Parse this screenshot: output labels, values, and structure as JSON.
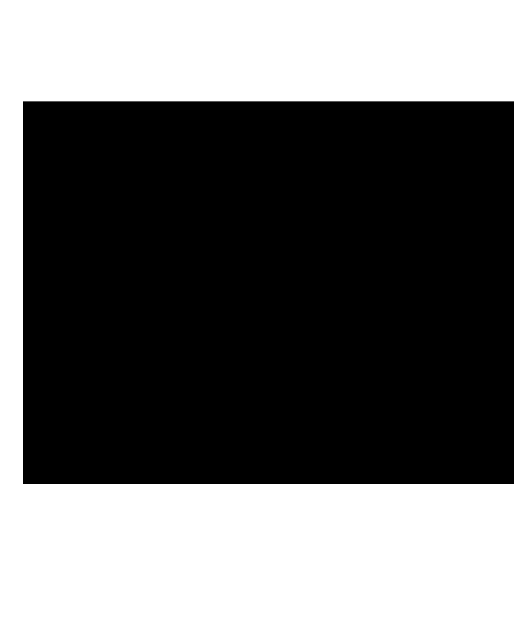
{
  "page": {
    "background_color": "#ffffff"
  },
  "media": {
    "kind": "blank-black-frame",
    "fill_color": "#000000"
  }
}
